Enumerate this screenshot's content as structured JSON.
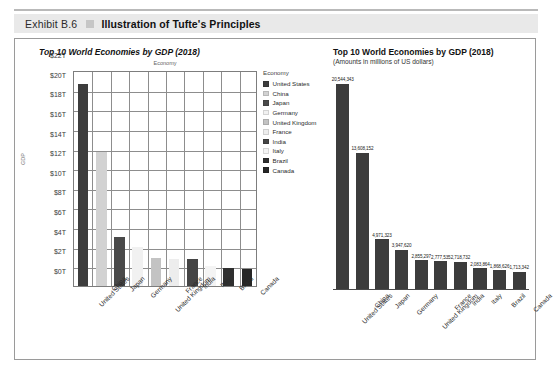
{
  "exhibit": {
    "number": "Exhibit B.6",
    "title": "Illustration of Tufte's Principles"
  },
  "left_chart": {
    "title": "Top 10 World Economies by GDP (2018)",
    "plot_caption": "Economy",
    "y_axis_title": "GDP",
    "y_ticks": [
      "$22T",
      "$20T",
      "$18T",
      "$16T",
      "$14T",
      "$12T",
      "$10T",
      "$8T",
      "$6T",
      "$4T",
      "$2T",
      "$0T"
    ],
    "legend": {
      "title": "Economy",
      "items": [
        {
          "label": "United States",
          "color": "#3d3d3d"
        },
        {
          "label": "China",
          "color": "#d2d2d2"
        },
        {
          "label": "Japan",
          "color": "#4a4a4a"
        },
        {
          "label": "Germany",
          "color": "#f1f1f1"
        },
        {
          "label": "United Kingdom",
          "color": "#c3c3c3"
        },
        {
          "label": "France",
          "color": "#ededed"
        },
        {
          "label": "India",
          "color": "#454545"
        },
        {
          "label": "Italy",
          "color": "#f4f4f4"
        },
        {
          "label": "Brazil",
          "color": "#2f2f2f"
        },
        {
          "label": "Canada",
          "color": "#262626"
        }
      ]
    }
  },
  "right_chart": {
    "title": "Top 10 World Economies by GDP (2018)",
    "subtitle": "(Amounts in millions of US dollars)",
    "bar_color": "#3c3c3c"
  },
  "chart_data": [
    {
      "type": "bar",
      "id": "left-chartjunk-version",
      "title": "Top 10 World Economies by GDP (2018)",
      "xlabel": "Economy",
      "ylabel": "GDP",
      "categories": [
        "United States",
        "China",
        "Japan",
        "Germany",
        "United Kingdom",
        "France",
        "India",
        "Italy",
        "Brazil",
        "Canada"
      ],
      "values": [
        20.544343,
        13.608152,
        4.971323,
        3.94762,
        2.855297,
        2.777535,
        2.718732,
        2.083864,
        1.868626,
        1.713342
      ],
      "value_unit": "trillions of US dollars",
      "ylim": [
        0,
        22
      ],
      "ytick_labels": [
        "$0T",
        "$2T",
        "$4T",
        "$6T",
        "$8T",
        "$10T",
        "$12T",
        "$14T",
        "$16T",
        "$18T",
        "$20T",
        "$22T"
      ],
      "grid": true,
      "legend_position": "right",
      "legend_title": "Economy",
      "series_colors": [
        "#3d3d3d",
        "#d2d2d2",
        "#4a4a4a",
        "#f1f1f1",
        "#c3c3c3",
        "#ededed",
        "#454545",
        "#f4f4f4",
        "#2f2f2f",
        "#262626"
      ]
    },
    {
      "type": "bar",
      "id": "right-tufte-version",
      "title": "Top 10 World Economies by GDP (2018)",
      "subtitle": "(Amounts in millions of US dollars)",
      "xlabel": "",
      "ylabel": "",
      "categories": [
        "United States",
        "China",
        "Japan",
        "Germany",
        "United Kingdom",
        "France",
        "India",
        "Italy",
        "Brazil",
        "Canada"
      ],
      "values": [
        20544343,
        13608152,
        4971323,
        3947620,
        2855297,
        2777535,
        2718732,
        2083864,
        1868626,
        1713342
      ],
      "data_labels": [
        "20,544,343",
        "13,608,152",
        "4,971,323",
        "3,947,620",
        "2,855,297",
        "2,777,535",
        "2,718,732",
        "2,083,864",
        "1,868,626",
        "1,713,342"
      ],
      "value_unit": "millions of US dollars",
      "ylim": [
        0,
        22000000
      ],
      "grid": false,
      "legend_position": "none",
      "series_colors": [
        "#3c3c3c"
      ]
    }
  ]
}
